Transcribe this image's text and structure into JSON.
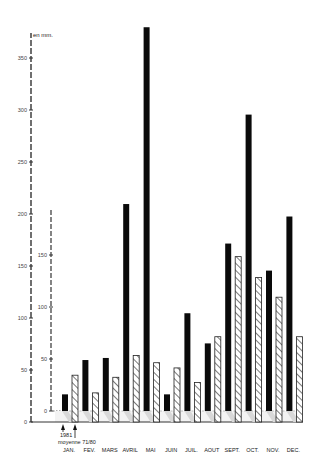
{
  "chart_data": {
    "type": "bar",
    "title": "",
    "unit_label": "en mm.",
    "xlabel": "",
    "ylabel": "en mm.",
    "categories": [
      "JAN.",
      "FEV.",
      "MARS",
      "AVRIL",
      "MAI",
      "JUIN",
      "JUIL.",
      "AOUT",
      "SEPT.",
      "OCT.",
      "NOV.",
      "DEC."
    ],
    "series": [
      {
        "name": "1981",
        "style": "solid-black",
        "values": [
          16,
          49,
          51,
          199,
          369,
          16,
          94,
          65,
          161,
          285,
          135,
          187
        ]
      },
      {
        "name": "moyenne 71/80",
        "style": "hatched",
        "values": [
          45,
          28,
          43,
          64,
          57,
          52,
          38,
          82,
          159,
          139,
          120,
          82
        ]
      }
    ],
    "outer_axis": {
      "ticks": [
        0,
        50,
        100,
        150,
        200,
        250,
        300,
        350
      ],
      "ylim": [
        0,
        360
      ]
    },
    "inner_axis": {
      "ticks": [
        0,
        50,
        100,
        150
      ],
      "ylim": [
        0,
        200
      ]
    },
    "grid": false,
    "legend": {
      "position": "below-first-category",
      "entries": [
        "1981",
        "moyenne 71/80"
      ]
    }
  },
  "labels": {
    "unit": "en mm.",
    "legend_1981": "1981",
    "legend_avg": "moyenne 71/80",
    "outer_ticks": [
      "0",
      "50",
      "100",
      "150",
      "200",
      "250",
      "300",
      "350"
    ],
    "inner_ticks": [
      "0",
      "50",
      "100",
      "150"
    ]
  },
  "colors": {
    "solid": "#0a0a0a",
    "hatch": "#222222",
    "axis": "#333333",
    "shadow": "#d8d8d8"
  }
}
